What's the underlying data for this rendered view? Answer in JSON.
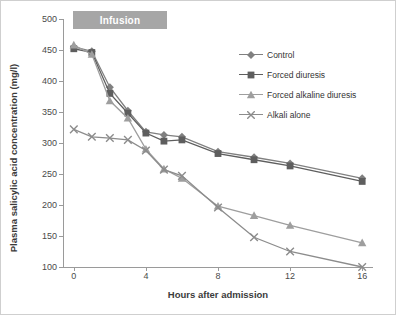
{
  "chart_data": {
    "type": "line",
    "title": "",
    "xlabel": "Hours after admission",
    "ylabel": "Plasma salicylic acid concentration (mg/l)",
    "xlim": [
      -0.6,
      16.6
    ],
    "ylim": [
      100,
      500
    ],
    "xticks": [
      "0",
      "4",
      "8",
      "12",
      "16"
    ],
    "yticks": [
      "100",
      "150",
      "200",
      "250",
      "300",
      "350",
      "400",
      "450",
      "500"
    ],
    "grid": false,
    "legend_position": "right-top",
    "annotations": [
      {
        "name": "infusion-band",
        "text": "Infusion",
        "x_start": 0.5,
        "x_end": 5.5
      }
    ],
    "x": [
      0,
      1,
      2,
      3,
      4,
      5,
      6,
      8,
      10,
      12,
      16
    ],
    "series": [
      {
        "name": "Control",
        "color": "#808080",
        "marker": "diamond",
        "values": [
          455,
          448,
          390,
          352,
          318,
          313,
          310,
          286,
          277,
          267,
          243
        ]
      },
      {
        "name": "Forced diuresis",
        "color": "#5e5e5e",
        "marker": "square",
        "values": [
          452,
          446,
          380,
          348,
          316,
          303,
          305,
          283,
          273,
          263,
          238
        ]
      },
      {
        "name": "Forced alkaline diuresis",
        "color": "#9e9e9e",
        "marker": "triangle",
        "values": [
          458,
          443,
          368,
          340,
          290,
          258,
          243,
          198,
          183,
          167,
          139
        ]
      },
      {
        "name": "Alkali alone",
        "color": "#8c8c8c",
        "marker": "cross",
        "values": [
          322,
          310,
          308,
          305,
          288,
          257,
          247,
          196,
          148,
          125,
          100
        ]
      }
    ]
  }
}
